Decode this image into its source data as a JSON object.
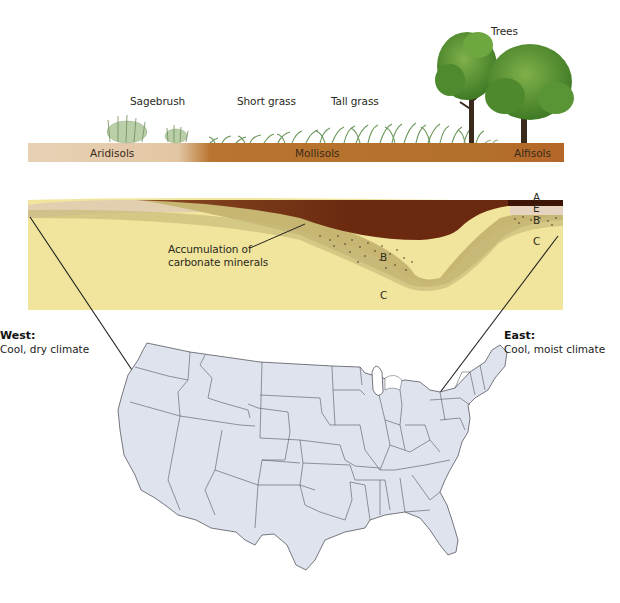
{
  "vegetation": {
    "sagebrush": "Sagebrush",
    "short_grass": "Short grass",
    "tall_grass": "Tall grass",
    "trees": "Trees"
  },
  "soil_orders": {
    "aridisols": "Aridisols",
    "mollisols": "Mollisols",
    "alfisols": "Alfisols"
  },
  "cross_section": {
    "annotation": [
      "Accumulation of",
      "carbonate minerals"
    ],
    "horizons": {
      "mollisol_B": "B",
      "mollisol_C": "C",
      "alfisol_A": "A",
      "alfisol_E": "E",
      "alfisol_B": "B",
      "alfisol_C": "C"
    }
  },
  "regions": {
    "west": {
      "title": "West:",
      "climate": "Cool, dry climate"
    },
    "east": {
      "title": "East:",
      "climate": "Cool, moist climate"
    }
  },
  "colors": {
    "aridisol_bar": "#e6cdb0",
    "mollisol_bar": "#b5702a",
    "alfisol_bar": "#b86a2c",
    "parent_material": "#f2e7a0",
    "b_horizon": "#c7b976",
    "a_horizon_dark": "#6b2a10",
    "map_fill": "#dfe3ee",
    "map_stroke": "#55585e"
  }
}
